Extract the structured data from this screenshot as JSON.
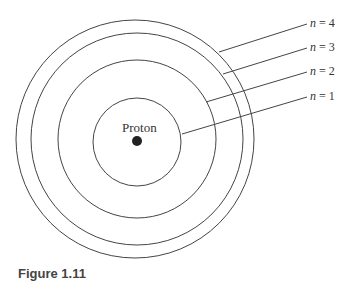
{
  "diagram": {
    "nucleus_label": "Proton",
    "orbits": [
      {
        "n": "1",
        "label_var": "n",
        "label_eq": " = 1",
        "r": 44
      },
      {
        "n": "2",
        "label_var": "n",
        "label_eq": " = 2",
        "r": 79
      },
      {
        "n": "3",
        "label_var": "n",
        "label_eq": " = 3",
        "r": 106
      },
      {
        "n": "4",
        "label_var": "n",
        "label_eq": " = 4",
        "r": 119
      }
    ],
    "caption": "Figure 1.11"
  }
}
